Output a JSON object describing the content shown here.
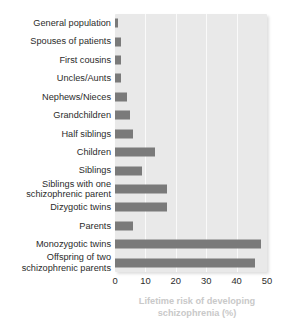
{
  "chart_data": {
    "type": "bar",
    "orientation": "horizontal",
    "title": "",
    "subtitle": "",
    "xlabel": "Lifetime risk of developing\nschizophrenia (%)",
    "ylabel": "",
    "xlim": [
      0,
      50
    ],
    "xticks": [
      "0",
      "10",
      "20",
      "30",
      "40",
      "50"
    ],
    "grid": true,
    "legend": null,
    "categories": [
      "General population",
      "Spouses of patients",
      "First cousins",
      "Uncles/Aunts",
      "Nephews/Nieces",
      "Grandchildren",
      "Half siblings",
      "Children",
      "Siblings",
      "Siblings with one\nschizophrenic parent",
      "Dizygotic twins",
      "Parents",
      "Monozygotic twins",
      "Offspring of two\nschizophrenic parents"
    ],
    "values": [
      1,
      2,
      2,
      2,
      4,
      5,
      6,
      13,
      9,
      17,
      17,
      6,
      48,
      46
    ],
    "colors": {
      "bar": "#7a7a7a",
      "plot_background": "#e9e9e9",
      "gridline": "#fafafa",
      "label_text": "#2b2b2b",
      "axis_title_text": "#c9c9c9",
      "page_background": "#ffffff"
    }
  }
}
